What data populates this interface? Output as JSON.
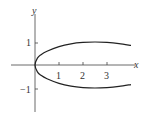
{
  "chart_data": {
    "type": "line",
    "title": "",
    "xlabel": "x",
    "ylabel": "y",
    "xlim": [
      -1,
      4.2
    ],
    "ylim": [
      -1.6,
      1.8
    ],
    "x_ticks": [
      "1",
      "2",
      "3"
    ],
    "y_ticks": [
      "1",
      "-1"
    ],
    "grid": false,
    "series": [
      {
        "name": "upper branch",
        "x": [
          0,
          0.1,
          0.25,
          0.5,
          1,
          1.5,
          2,
          2.5,
          3,
          3.5,
          4
        ],
        "y": [
          0,
          0.3,
          0.45,
          0.6,
          0.8,
          0.92,
          0.98,
          1.0,
          0.98,
          0.93,
          0.85
        ]
      },
      {
        "name": "lower branch",
        "x": [
          0,
          0.1,
          0.25,
          0.5,
          1,
          1.5,
          2,
          2.5,
          3,
          3.5,
          4
        ],
        "y": [
          0,
          -0.3,
          -0.45,
          -0.6,
          -0.8,
          -0.92,
          -0.98,
          -1.0,
          -0.98,
          -0.93,
          -0.85
        ]
      }
    ]
  },
  "labels": {
    "x_axis": "x",
    "y_axis": "y",
    "x1": "1",
    "x2": "2",
    "x3": "3",
    "y1": "1",
    "yneg1": "−1"
  }
}
